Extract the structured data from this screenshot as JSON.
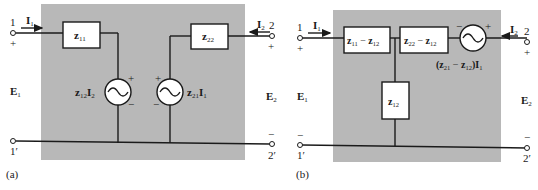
{
  "colors": {
    "panel": "#b8b8b8",
    "line": "#1a1a1a",
    "box": "#ffffff"
  },
  "a": {
    "caption": "(a)",
    "terminals": {
      "t1": "1",
      "t1p": "1′",
      "t2": "2",
      "t2p": "2′"
    },
    "currents": {
      "i1": "I",
      "i1_sub": "1",
      "i2": "I",
      "i2_sub": "2"
    },
    "voltages": {
      "e1": "E",
      "e1_sub": "1",
      "e2": "E",
      "e2_sub": "2"
    },
    "plus": "+",
    "minus": "−",
    "z11": {
      "main": "z",
      "sub": "11"
    },
    "z22": {
      "main": "z",
      "sub": "22"
    },
    "src1": {
      "z": "z",
      "zsub": "12",
      "i": "I",
      "isub": "2"
    },
    "src2": {
      "z": "z",
      "zsub": "21",
      "i": "I",
      "isub": "1"
    }
  },
  "b": {
    "caption": "(b)",
    "terminals": {
      "t1": "1",
      "t1p": "1′",
      "t2": "2",
      "t2p": "2′"
    },
    "currents": {
      "i1": "I",
      "i1_sub": "1",
      "i2": "I",
      "i2_sub": "2"
    },
    "voltages": {
      "e1": "E",
      "e1_sub": "1",
      "e2": "E",
      "e2_sub": "2"
    },
    "plus": "+",
    "minus": "−",
    "box1": {
      "a": "z",
      "asub": "11",
      "op": " − ",
      "b": "z",
      "bsub": "12"
    },
    "box2": {
      "a": "z",
      "asub": "22",
      "op": " − ",
      "b": "z",
      "bsub": "12"
    },
    "box3": {
      "main": "z",
      "sub": "12"
    },
    "src": {
      "open": "(",
      "a": "z",
      "asub": "21",
      "op": " − ",
      "b": "z",
      "bsub": "12",
      "close": ")",
      "i": "I",
      "isub": "1"
    }
  }
}
